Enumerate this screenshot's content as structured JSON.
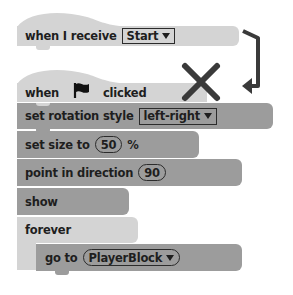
{
  "diagram": {
    "colors": {
      "light_block": "#d4d4d4",
      "dark_block": "#9c9c9c",
      "text": "#1e1e1e",
      "annotation": "#3a3a3a"
    }
  },
  "blocks": {
    "receive_hat": {
      "label": "when I receive",
      "dropdown": "Start"
    },
    "flag_hat": {
      "label_before": "when",
      "icon": "green-flag-icon",
      "label_after": "clicked"
    },
    "rotation": {
      "label": "set rotation style",
      "dropdown": "left-right"
    },
    "size": {
      "label": "set size to",
      "value": "50",
      "suffix": "%"
    },
    "direction": {
      "label": "point in direction",
      "value": "90"
    },
    "show": {
      "label": "show"
    },
    "forever": {
      "label": "forever"
    },
    "goto": {
      "label": "go to",
      "dropdown": "PlayerBlock"
    }
  },
  "annotations": {
    "cross": "x-mark-icon",
    "arrow": "bent-arrow-icon"
  }
}
